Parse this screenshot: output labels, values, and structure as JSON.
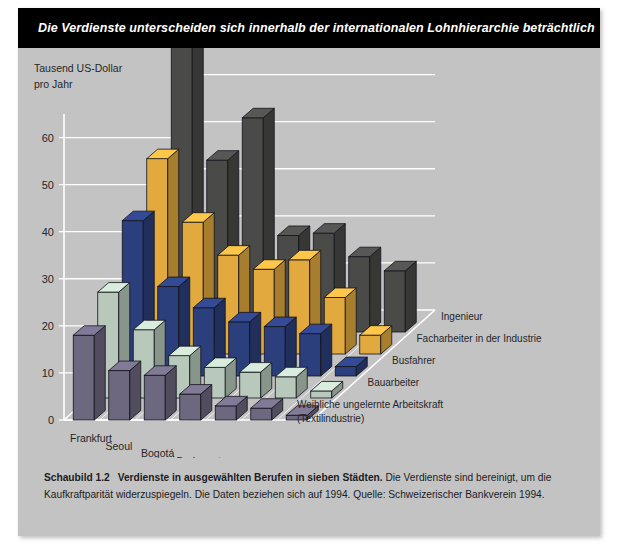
{
  "banner": {
    "title": "Die Verdienste unterscheiden sich innerhalb der internationalen Lohnhierarchie beträchtlich"
  },
  "caption": {
    "figure_number": "Schaubild 1.2",
    "headline": "Verdienste in ausgewählten Berufen in sieben Städten.",
    "body": "Die Verdienste sind bereinigt, um die Kaufkraftparität widerzuspiegeln. Die Daten beziehen sich auf 1994. Quelle: Schweizerischer Bankverein 1994."
  },
  "chart_data": {
    "type": "bar",
    "title": "Die Verdienste unterscheiden sich innerhalb der internationalen Lohnhierarchie beträchtlich",
    "subtitle": "Verdienste in ausgewählten Berufen in sieben Städten",
    "xlabel": "",
    "ylabel": "Tausend US-Dollar pro Jahr",
    "ylabel_line1": "Tausend US-Dollar",
    "ylabel_line2": "pro Jahr",
    "ylim": [
      0,
      65
    ],
    "yticks": [
      0,
      10,
      20,
      30,
      40,
      50,
      60
    ],
    "ytick_labels": [
      "0",
      "10",
      "20",
      "30",
      "40",
      "50",
      "60"
    ],
    "grid": true,
    "legend_position": "right-inline",
    "projection": "3d-grouped",
    "categories": [
      "Frankfurt",
      "Seoul",
      "Bogotá",
      "Budapest",
      "Jakarta",
      "Bombay",
      "Nairobi"
    ],
    "series": [
      {
        "name": "Weibliche ungelernte Arbeitskraft (Textilindustrie)",
        "name_line1": "Weibliche ungelernte Arbeitskraft",
        "name_line2": "(Textilindustrie)",
        "color": "#6d6880",
        "values": [
          18.0,
          10.5,
          9.5,
          5.5,
          3.0,
          2.5,
          1.0
        ]
      },
      {
        "name": "Bauarbeiter",
        "color": "#b8c9bc",
        "values": [
          22.5,
          14.5,
          9.0,
          6.5,
          5.5,
          4.5,
          1.5
        ]
      },
      {
        "name": "Busfahrer",
        "color": "#2c3f7d",
        "values": [
          33.0,
          19.0,
          14.5,
          11.5,
          10.5,
          9.0,
          2.0
        ]
      },
      {
        "name": "Facharbeiter in der Industrie",
        "color": "#e2a93e",
        "values": [
          41.5,
          28.0,
          21.0,
          18.0,
          20.0,
          12.0,
          4.0
        ]
      },
      {
        "name": "Ingenieur",
        "color": "#4a4a48",
        "values": [
          61.0,
          36.5,
          45.5,
          20.5,
          21.0,
          16.0,
          13.0
        ]
      }
    ]
  }
}
